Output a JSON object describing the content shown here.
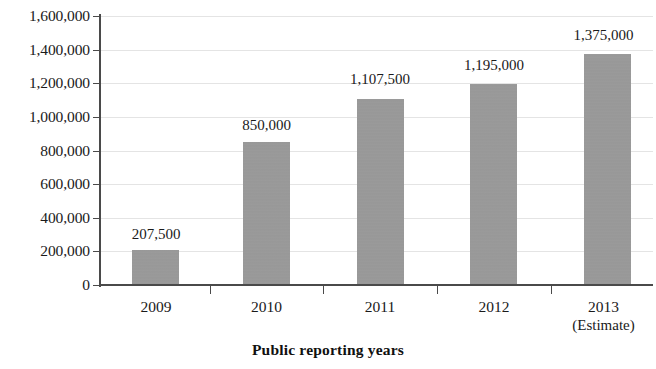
{
  "chart_data": {
    "type": "bar",
    "title": "",
    "xlabel": "Public reporting years",
    "ylabel": "",
    "categories": [
      "2009",
      "2010",
      "2011",
      "2012",
      "2013"
    ],
    "category_sublabels": [
      "",
      "",
      "",
      "",
      "(Estimate)"
    ],
    "values": [
      207500,
      850000,
      1107500,
      1195000,
      1375000
    ],
    "data_labels": [
      "207,500",
      "850,000",
      "1,107,500",
      "1,195,000",
      "1,375,000"
    ],
    "ylim": [
      0,
      1600000
    ],
    "ytick_step": 200000,
    "ytick_labels": [
      "1,600,000",
      "1,400,000",
      "1,200,000",
      "1,000,000",
      "800,000",
      "600,000",
      "400,000",
      "200,000",
      "0"
    ],
    "ytick_values": [
      1600000,
      1400000,
      1200000,
      1000000,
      800000,
      600000,
      400000,
      200000,
      0
    ],
    "grid": true,
    "legend": false,
    "bar_color": "#9a9a9a",
    "axis_color": "#4a4a4a",
    "gridline_color": "#e4e4e4",
    "background_color": "#ffffff"
  }
}
